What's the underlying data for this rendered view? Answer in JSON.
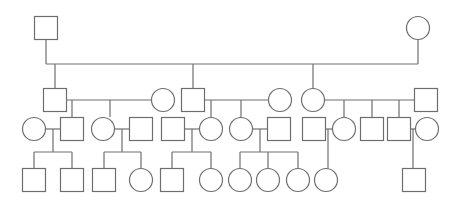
{
  "diagram": {
    "type": "pedigree",
    "stroke_color": "#6e6e6e",
    "background": "#ffffff",
    "symbol_size": 23,
    "individuals": [
      {
        "id": "I-1",
        "sex": "male",
        "gen": 1,
        "cx": 46,
        "cy": 28
      },
      {
        "id": "I-2",
        "sex": "female",
        "gen": 1,
        "cx": 418,
        "cy": 28
      },
      {
        "id": "II-1",
        "sex": "male",
        "gen": 2,
        "cx": 55,
        "cy": 100
      },
      {
        "id": "II-2",
        "sex": "female",
        "gen": 2,
        "cx": 163,
        "cy": 100
      },
      {
        "id": "II-3",
        "sex": "male",
        "gen": 2,
        "cx": 193,
        "cy": 100
      },
      {
        "id": "II-4",
        "sex": "female",
        "gen": 2,
        "cx": 280,
        "cy": 100
      },
      {
        "id": "II-5",
        "sex": "female",
        "gen": 2,
        "cx": 313,
        "cy": 100
      },
      {
        "id": "II-6",
        "sex": "male",
        "gen": 2,
        "cx": 426,
        "cy": 100
      },
      {
        "id": "III-1",
        "sex": "female",
        "gen": 3,
        "cx": 34,
        "cy": 129
      },
      {
        "id": "III-2",
        "sex": "male",
        "gen": 3,
        "cx": 72,
        "cy": 129
      },
      {
        "id": "III-3",
        "sex": "female",
        "gen": 3,
        "cx": 103,
        "cy": 129
      },
      {
        "id": "III-4",
        "sex": "male",
        "gen": 3,
        "cx": 141,
        "cy": 129
      },
      {
        "id": "III-5",
        "sex": "male",
        "gen": 3,
        "cx": 173,
        "cy": 129
      },
      {
        "id": "III-6",
        "sex": "female",
        "gen": 3,
        "cx": 211,
        "cy": 129
      },
      {
        "id": "III-7",
        "sex": "female",
        "gen": 3,
        "cx": 241,
        "cy": 129
      },
      {
        "id": "III-8",
        "sex": "male",
        "gen": 3,
        "cx": 279,
        "cy": 129
      },
      {
        "id": "III-9",
        "sex": "male",
        "gen": 3,
        "cx": 314,
        "cy": 129
      },
      {
        "id": "III-10",
        "sex": "female",
        "gen": 3,
        "cx": 344,
        "cy": 129
      },
      {
        "id": "III-11",
        "sex": "male",
        "gen": 3,
        "cx": 372,
        "cy": 129
      },
      {
        "id": "III-12",
        "sex": "male",
        "gen": 3,
        "cx": 399,
        "cy": 129
      },
      {
        "id": "III-13",
        "sex": "female",
        "gen": 3,
        "cx": 427,
        "cy": 129
      },
      {
        "id": "IV-1",
        "sex": "male",
        "gen": 4,
        "cx": 34,
        "cy": 180
      },
      {
        "id": "IV-2",
        "sex": "male",
        "gen": 4,
        "cx": 72,
        "cy": 180
      },
      {
        "id": "IV-3",
        "sex": "male",
        "gen": 4,
        "cx": 104,
        "cy": 180
      },
      {
        "id": "IV-4",
        "sex": "female",
        "gen": 4,
        "cx": 141,
        "cy": 180
      },
      {
        "id": "IV-5",
        "sex": "male",
        "gen": 4,
        "cx": 172,
        "cy": 180
      },
      {
        "id": "IV-6",
        "sex": "female",
        "gen": 4,
        "cx": 211,
        "cy": 180
      },
      {
        "id": "IV-7",
        "sex": "female",
        "gen": 4,
        "cx": 240,
        "cy": 180
      },
      {
        "id": "IV-8",
        "sex": "female",
        "gen": 4,
        "cx": 268,
        "cy": 180
      },
      {
        "id": "IV-9",
        "sex": "female",
        "gen": 4,
        "cx": 298,
        "cy": 180
      },
      {
        "id": "IV-10",
        "sex": "female",
        "gen": 4,
        "cx": 326,
        "cy": 180
      },
      {
        "id": "IV-11",
        "sex": "male",
        "gen": 4,
        "cx": 414,
        "cy": 180
      }
    ],
    "lines": [
      [
        46,
        40,
        46,
        64
      ],
      [
        46,
        64,
        418,
        64
      ],
      [
        418,
        64,
        418,
        40
      ],
      [
        55,
        64,
        55,
        88
      ],
      [
        193,
        64,
        193,
        88
      ],
      [
        313,
        64,
        313,
        88
      ],
      [
        67,
        100,
        151,
        100
      ],
      [
        72,
        100,
        72,
        117
      ],
      [
        110,
        100,
        110,
        117
      ],
      [
        205,
        100,
        268,
        100
      ],
      [
        211,
        100,
        211,
        117
      ],
      [
        241,
        100,
        241,
        117
      ],
      [
        325,
        100,
        414,
        100
      ],
      [
        344,
        100,
        344,
        117
      ],
      [
        372,
        100,
        372,
        117
      ],
      [
        399,
        100,
        399,
        117
      ],
      [
        46,
        129,
        60,
        129
      ],
      [
        53,
        129,
        53,
        152
      ],
      [
        34,
        152,
        72,
        152
      ],
      [
        34,
        152,
        34,
        168
      ],
      [
        72,
        152,
        72,
        168
      ],
      [
        115,
        129,
        129,
        129
      ],
      [
        122,
        129,
        122,
        152
      ],
      [
        104,
        152,
        141,
        152
      ],
      [
        104,
        152,
        104,
        168
      ],
      [
        141,
        152,
        141,
        168
      ],
      [
        185,
        129,
        199,
        129
      ],
      [
        192,
        129,
        192,
        152
      ],
      [
        172,
        152,
        211,
        152
      ],
      [
        172,
        152,
        172,
        168
      ],
      [
        211,
        152,
        211,
        168
      ],
      [
        253,
        129,
        267,
        129
      ],
      [
        260,
        129,
        260,
        152
      ],
      [
        240,
        152,
        298,
        152
      ],
      [
        240,
        152,
        240,
        168
      ],
      [
        268,
        152,
        268,
        168
      ],
      [
        298,
        152,
        298,
        168
      ],
      [
        326,
        129,
        332,
        129
      ],
      [
        328,
        129,
        328,
        168
      ],
      [
        411,
        129,
        415,
        129
      ],
      [
        413,
        129,
        413,
        168
      ]
    ]
  }
}
